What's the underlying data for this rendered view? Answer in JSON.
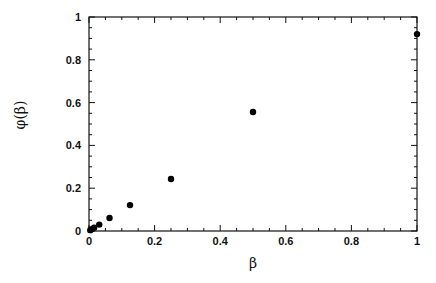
{
  "chart_data": {
    "type": "scatter",
    "title": "",
    "xlabel": "β",
    "ylabel": "φ(β)",
    "xlim": [
      0,
      1
    ],
    "ylim": [
      0,
      1
    ],
    "grid": false,
    "legend": null,
    "x_ticks": [
      "0",
      "0.2",
      "0.4",
      "0.6",
      "0.8",
      "1"
    ],
    "y_ticks": [
      "0",
      "0.2",
      "0.4",
      "0.6",
      "0.8",
      "1"
    ],
    "series": [
      {
        "name": "phi",
        "marker": "filled-circle",
        "color": "#000000",
        "x": [
          0.0039,
          0.0078,
          0.0156,
          0.03125,
          0.0625,
          0.125,
          0.25,
          0.5,
          1.0
        ],
        "y": [
          0.004,
          0.008,
          0.015,
          0.03,
          0.061,
          0.121,
          0.243,
          0.556,
          0.92
        ]
      }
    ]
  }
}
